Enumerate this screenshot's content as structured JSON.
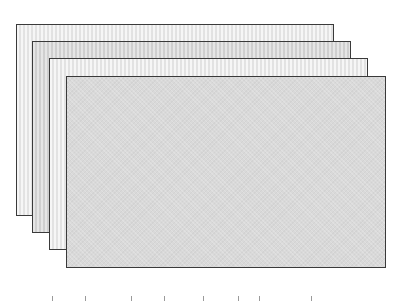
{
  "diagram": {
    "sheets": [
      {
        "id": "sheet-1",
        "x": 16,
        "y": 24,
        "width": 318,
        "height": 192,
        "fill": "#ebebeb",
        "border": "#3a3a3a"
      },
      {
        "id": "sheet-2",
        "x": 32,
        "y": 41,
        "width": 319,
        "height": 192,
        "fill": "#d8d8d8",
        "border": "#3a3a3a"
      },
      {
        "id": "sheet-3",
        "x": 49,
        "y": 58,
        "width": 319,
        "height": 192,
        "fill": "#ebebeb",
        "border": "#3a3a3a"
      },
      {
        "id": "sheet-4",
        "x": 66,
        "y": 76,
        "width": 320,
        "height": 192,
        "fill": "#d9d9d9",
        "border": "#3a3a3a"
      }
    ],
    "bottom_markers_x": [
      52,
      85,
      131,
      164,
      203,
      238,
      259,
      311
    ]
  }
}
